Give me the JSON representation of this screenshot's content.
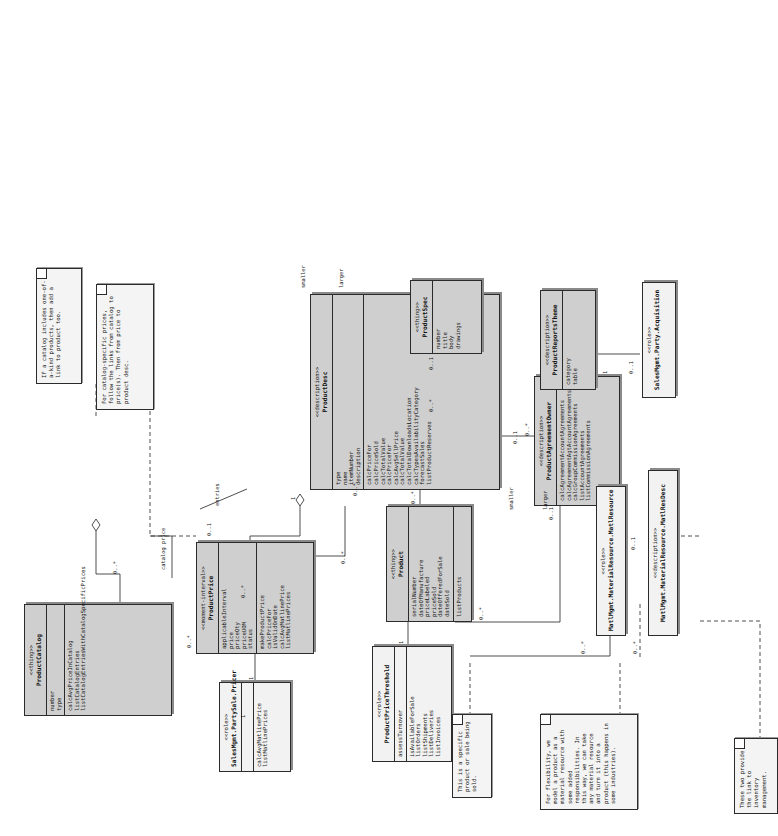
{
  "diagram": {
    "type": "uml-class-diagram",
    "orientation": "rotated-90-ccw"
  },
  "classes": [
    {
      "id": "productCatalog",
      "stereotype": "<<thing>>",
      "name": "ProductCatalog",
      "attributes": [
        "number",
        "type"
      ],
      "operations": [
        "calcAvgPriceInCatalog",
        "listCatalogEntries",
        "listCatalogEntriesWithCatalogSpecificPrices"
      ],
      "fill": "grey"
    },
    {
      "id": "productPrice",
      "stereotype": "<<moment-interval>>",
      "name": "ProductPrice",
      "attributes": [
        "applicableInterval",
        "price",
        "priceQty",
        "priceUOM",
        "status"
      ],
      "operations": [
        "makeProductPrice",
        "calcPriceFor",
        "isValidOnDate",
        "calcAvgMatlinePrice",
        "listMatlinePrices"
      ],
      "fill": "grey"
    },
    {
      "id": "salesMgmtPartySalePricer",
      "stereotype": "<<role>>",
      "name": "SalesMgmt.PartySale.Pricer",
      "attributes": [],
      "operations": [
        "calcAvgMatlinePrice",
        "listMatlinePrices"
      ],
      "fill": "white"
    },
    {
      "id": "productPriceThreshold",
      "stereotype": "<<role>>",
      "name": "ProductPriceThreshold",
      "attributes": [
        "assessTurnover"
      ],
      "operations": [
        "isAvailableForSale",
        "listOrders",
        "listShipments",
        "listDeliveries",
        "listInvoices"
      ],
      "fill": "white"
    },
    {
      "id": "product",
      "stereotype": "<<thing>>",
      "name": "Product",
      "attributes": [
        "serialNumber",
        "dateOfManufacture",
        "priceLabeled",
        "priceSold",
        "dateOfferedForSale",
        "dateSold"
      ],
      "operations": [
        "listProducts"
      ],
      "fill": "grey"
    },
    {
      "id": "productDesc",
      "stereotype": "<<description>>",
      "name": "ProductDesc",
      "attributes": [
        "type",
        "name",
        "itemNumber",
        "description",
        "calcPriceFor",
        "calcPriceSold",
        "calcTotalValue",
        "calcPriceFor",
        "calcAvgSellPrice",
        "calcTotalValue",
        "calcTotalDownloadsLocation",
        "calcTypesAvailabilityCategory",
        "forecastSales",
        "listProductReserves"
      ],
      "operations": [],
      "fill": "grey"
    },
    {
      "id": "productSpec",
      "stereotype": "<<thing>>",
      "name": "ProductSpec",
      "attributes": [
        "number",
        "title",
        "body",
        "drawings"
      ],
      "operations": [],
      "fill": "grey"
    },
    {
      "id": "productAgreementOwner",
      "stereotype": "<<description>>",
      "name": "ProductAgreementOwner",
      "attributes": [],
      "operations": [
        "calcAgreementAccountAgreements",
        "calcAgreementAgtAccountAgreements",
        "calcGroupCommissionAgreements",
        "listAccountAgreements",
        "listCommissionAgreements"
      ],
      "fill": "grey"
    },
    {
      "id": "productReportsTheme",
      "stereotype": "<<description>>",
      "name": "ProductReportsTheme",
      "attributes": [
        "category",
        "table"
      ],
      "operations": [],
      "fill": "grey"
    },
    {
      "id": "salesMgmtPartyAcquisition",
      "stereotype": "<<role>>",
      "name": "SalesMgmt.Party.Acquisition",
      "attributes": [],
      "operations": [],
      "fill": "white"
    },
    {
      "id": "matlMgmtMaterialResource",
      "stereotype": "<<role>>",
      "name": "MatlMgmt.MaterialResource.MatlResource",
      "attributes": [],
      "operations": [],
      "fill": "white"
    },
    {
      "id": "matlMgmtMaterialResourceDesc",
      "stereotype": "<<description>>",
      "name": "MatlMgmt.MaterialResource.MatlResDesc",
      "attributes": [],
      "operations": [],
      "fill": "white"
    }
  ],
  "notes": [
    {
      "id": "noteCatalogPrices",
      "text": "For catalog-specific prices, follow the links from catalog to price(s). Then from price to product desc."
    },
    {
      "id": "noteCatalogIncludes",
      "text": "If a catalog includes one-of-a-kind products, then add a link to product too."
    },
    {
      "id": "noteSpecificProduct",
      "text": "This is a specific product or sale being sold."
    },
    {
      "id": "noteFlexibility",
      "text": "For flexibility, we model a product as a material resource with some added responsibilities. In this way, we can take any material resource and turn it into a product (this happens in some industries)."
    },
    {
      "id": "noteTwoProvide",
      "text": "These two provide the link to inventory management."
    }
  ],
  "multiplicities": [
    "1",
    "0..*",
    "0..*",
    "0..1",
    "1",
    "0..*",
    "0..1",
    "0..*",
    "0..1",
    "1",
    "0..*",
    "0..*",
    "0..1",
    "0..*",
    "1",
    "0..1",
    "0..*",
    "0..*",
    "0..1",
    "0..*",
    "0..*",
    "1"
  ],
  "edge_labels": [
    "catalog price",
    "entries",
    "smaller",
    "larger",
    "smaller",
    "larger"
  ],
  "colors": {
    "class_fill_grey": "#cfcfcf",
    "class_fill_white": "#f2f2f2",
    "note_fill": "#f4f4f4",
    "line": "#3a3a3a",
    "border": "#2b2b2b"
  }
}
